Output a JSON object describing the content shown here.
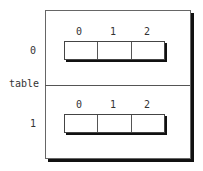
{
  "diagram": {
    "outer_label": "table",
    "rows": [
      {
        "label": "0",
        "indices": [
          "0",
          "1",
          "2"
        ],
        "cells": [
          "",
          "",
          ""
        ]
      },
      {
        "label": "1",
        "indices": [
          "0",
          "1",
          "2"
        ],
        "cells": [
          "",
          "",
          ""
        ]
      }
    ]
  }
}
